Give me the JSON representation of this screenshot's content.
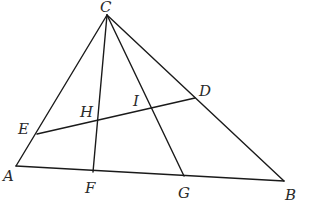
{
  "diagram": {
    "type": "geometry-triangle",
    "points": {
      "A": {
        "x": 16,
        "y": 166,
        "label": "A",
        "lx": 3,
        "ly": 181
      },
      "B": {
        "x": 284,
        "y": 181,
        "label": "B",
        "lx": 285,
        "ly": 200
      },
      "C": {
        "x": 107,
        "y": 15,
        "label": "C",
        "lx": 100,
        "ly": 12
      },
      "D": {
        "x": 195,
        "y": 98,
        "label": "D",
        "lx": 199,
        "ly": 96
      },
      "E": {
        "x": 37,
        "y": 134,
        "label": "E",
        "lx": 18,
        "ly": 134
      },
      "F": {
        "x": 93,
        "y": 172,
        "label": "F",
        "lx": 85,
        "ly": 193
      },
      "G": {
        "x": 184,
        "y": 176,
        "label": "G",
        "lx": 178,
        "ly": 198
      },
      "H": {
        "x": 98,
        "y": 121,
        "label": "H",
        "lx": 80,
        "ly": 117
      },
      "I": {
        "x": 153,
        "y": 108,
        "label": "I",
        "lx": 133,
        "ly": 106
      }
    },
    "segments": [
      [
        "A",
        "B"
      ],
      [
        "B",
        "C"
      ],
      [
        "C",
        "A"
      ],
      [
        "C",
        "F"
      ],
      [
        "C",
        "G"
      ],
      [
        "E",
        "D"
      ]
    ],
    "labels": [
      "A",
      "B",
      "C",
      "D",
      "E",
      "F",
      "G",
      "H",
      "I"
    ]
  }
}
